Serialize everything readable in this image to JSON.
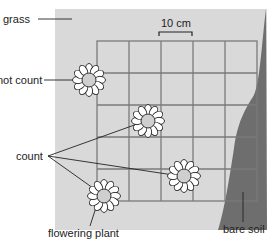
{
  "labels": {
    "grass": "grass",
    "scale": "10 cm",
    "not_count": "not count",
    "count": "count",
    "flowering_plant": "flowering plant",
    "bare_soil": "bare soil"
  },
  "colors": {
    "grass": "#d9d9d9",
    "bare_soil": "#6e6e6e",
    "grid": "#7a7a7a",
    "petal": "#ffffff",
    "flower_center": "#cfcfcf",
    "outline": "#222222"
  },
  "quadrat": {
    "grid_size": "5 x 5",
    "square_side": "10 cm"
  },
  "plants": [
    {
      "id": "plant-1",
      "status": "not count"
    },
    {
      "id": "plant-2",
      "status": "count"
    },
    {
      "id": "plant-3",
      "status": "count"
    },
    {
      "id": "plant-4",
      "status": "count"
    }
  ]
}
